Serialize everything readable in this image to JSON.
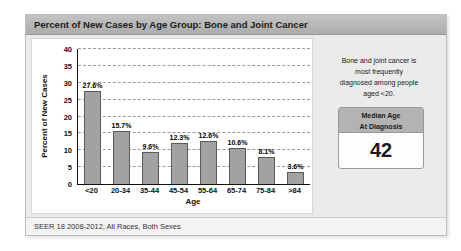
{
  "header": {
    "title": "Percent of New Cases by Age Group: Bone and Joint Cancer"
  },
  "chart_data": {
    "type": "bar",
    "title": "Percent of New Cases by Age Group: Bone and Joint Cancer",
    "categories": [
      "<20",
      "20-34",
      "35-44",
      "45-54",
      "55-64",
      "65-74",
      "75-84",
      ">84"
    ],
    "values": [
      27.6,
      15.7,
      9.6,
      12.3,
      12.6,
      10.6,
      8.1,
      3.6
    ],
    "value_labels": [
      "27.6%",
      "15.7%",
      "9.6%",
      "12.3%",
      "12.6%",
      "10.6%",
      "8.1%",
      "3.6%"
    ],
    "xlabel": "Age",
    "ylabel": "Percent of New Cases",
    "ylim": [
      0,
      40
    ],
    "ytick_interval": 5,
    "grid": "horizontal dashed",
    "legend": "none",
    "bar_color": "#a2a2a2",
    "bar_border_color": "#5a5a5a"
  },
  "side_panel": {
    "note_lines": [
      "Bone and joint cancer is",
      "most frequently",
      "diagnosed among people",
      "aged <20."
    ],
    "median_box": {
      "header_line1": "Median Age",
      "header_line2": "At Diagnosis",
      "value": "42"
    }
  },
  "footer": {
    "source_text": "SEER 18 2008-2012, All Races, Both Sexes"
  },
  "colors": {
    "title_bar": "#b8b8b8",
    "content_background": "#ebebeb",
    "panel_background": "#ffffff",
    "bar_fill": "#a2a2a2",
    "bar_border": "#5a5a5a",
    "median_header_background": "#b3b3b3",
    "footer_background": "#f3f3f3"
  }
}
